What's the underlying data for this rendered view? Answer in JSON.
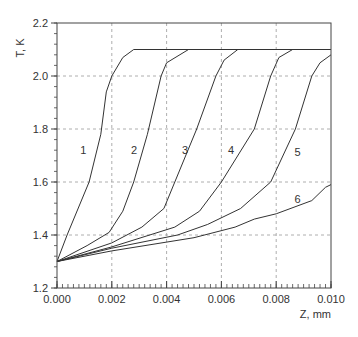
{
  "chart_data": {
    "type": "line",
    "title": "",
    "xlabel": "Z, mm",
    "ylabel": "T, K",
    "xlim": [
      0.0,
      0.01
    ],
    "ylim": [
      1.2,
      2.2
    ],
    "xticks": [
      "0.000",
      "0.002",
      "0.004",
      "0.006",
      "0.008",
      "0.010"
    ],
    "yticks": [
      "1.2",
      "1.4",
      "1.6",
      "1.8",
      "2.0",
      "2.2"
    ],
    "grid": "dashed at major ticks",
    "legend": "none (curves labeled inline 1-6)",
    "series": [
      {
        "name": "1",
        "label_pos": [
          0.00096,
          1.72
        ],
        "points": [
          [
            0.0,
            1.3
          ],
          [
            0.00037,
            1.4
          ],
          [
            0.00117,
            1.6
          ],
          [
            0.0016,
            1.78
          ],
          [
            0.0018,
            1.94
          ],
          [
            0.002,
            2.0
          ],
          [
            0.0024,
            2.07
          ],
          [
            0.0028,
            2.1
          ],
          [
            0.01,
            2.1
          ]
        ]
      },
      {
        "name": "2",
        "label_pos": [
          0.00281,
          1.72
        ],
        "points": [
          [
            0.0,
            1.3
          ],
          [
            0.0011,
            1.36
          ],
          [
            0.0019,
            1.41
          ],
          [
            0.0024,
            1.49
          ],
          [
            0.0028,
            1.6
          ],
          [
            0.0033,
            1.78
          ],
          [
            0.0038,
            2.0
          ],
          [
            0.004,
            2.05
          ],
          [
            0.0048,
            2.1
          ]
        ]
      },
      {
        "name": "3",
        "label_pos": [
          0.00467,
          1.72
        ],
        "points": [
          [
            0.0,
            1.3
          ],
          [
            0.002,
            1.37
          ],
          [
            0.0031,
            1.43
          ],
          [
            0.0039,
            1.5
          ],
          [
            0.0043,
            1.6
          ],
          [
            0.0051,
            1.8
          ],
          [
            0.0058,
            2.0
          ],
          [
            0.0061,
            2.06
          ],
          [
            0.0066,
            2.1
          ]
        ]
      },
      {
        "name": "4",
        "label_pos": [
          0.00635,
          1.72
        ],
        "points": [
          [
            0.0,
            1.3
          ],
          [
            0.002,
            1.355
          ],
          [
            0.0043,
            1.43
          ],
          [
            0.0052,
            1.49
          ],
          [
            0.006,
            1.6
          ],
          [
            0.0072,
            1.8
          ],
          [
            0.0078,
            2.0
          ],
          [
            0.0081,
            2.07
          ],
          [
            0.0086,
            2.1
          ]
        ]
      },
      {
        "name": "5",
        "label_pos": [
          0.00878,
          1.715
        ],
        "points": [
          [
            0.0,
            1.3
          ],
          [
            0.002,
            1.35
          ],
          [
            0.0044,
            1.4
          ],
          [
            0.0055,
            1.44
          ],
          [
            0.0067,
            1.5
          ],
          [
            0.0078,
            1.6
          ],
          [
            0.0087,
            1.8
          ],
          [
            0.0093,
            2.0
          ],
          [
            0.0096,
            2.05
          ],
          [
            0.01,
            2.08
          ]
        ]
      },
      {
        "name": "6",
        "label_pos": [
          0.00878,
          1.535
        ],
        "points": [
          [
            0.0,
            1.3
          ],
          [
            0.002,
            1.34
          ],
          [
            0.005,
            1.39
          ],
          [
            0.0065,
            1.43
          ],
          [
            0.0072,
            1.46
          ],
          [
            0.008,
            1.48
          ],
          [
            0.0093,
            1.53
          ],
          [
            0.0098,
            1.58
          ],
          [
            0.01,
            1.59
          ]
        ]
      }
    ]
  },
  "colors": {
    "line": "#333333",
    "grid": "#999999",
    "axis": "#444444"
  }
}
